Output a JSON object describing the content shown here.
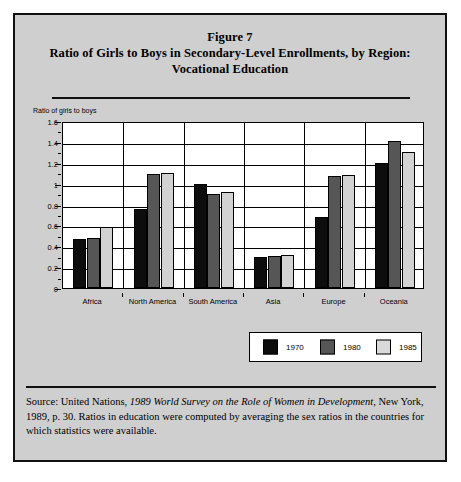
{
  "figure": {
    "title_line1": "Figure 7",
    "title_line2": "Ratio of Girls to Boys in Secondary-Level Enrollments, by Region:",
    "title_line3": "Vocational Education"
  },
  "source": {
    "prefix": "Source: United Nations, ",
    "italic_title": "1989 World Survey on the Role of Women in Development,",
    "rest": " New York, 1989, p. 30. Ratios in education were computed by averaging the sex ratios in the countries for which statistics were available."
  },
  "legend": {
    "entries": [
      {
        "label": "1970",
        "color": "#0d0d0d"
      },
      {
        "label": "1980",
        "color": "#565656"
      },
      {
        "label": "1985",
        "color": "#d9d9d9"
      }
    ]
  },
  "chart_data": {
    "type": "bar",
    "title": "Ratio of Girls to Boys in Secondary-Level Enrollments, by Region: Vocational Education",
    "xlabel": "",
    "ylabel": "Ratio of girls to boys",
    "ylim": [
      0,
      1.6
    ],
    "ytick_labels": [
      "1.6",
      "1.4",
      "1.2",
      "1",
      "0.8",
      "0.6",
      "0.4",
      "0.2",
      "0"
    ],
    "ytick_values": [
      1.6,
      1.4,
      1.2,
      1.0,
      0.8,
      0.6,
      0.4,
      0.2,
      0
    ],
    "grid": true,
    "legend_position": "below-right",
    "categories": [
      "Africa",
      "North America",
      "South America",
      "Asia",
      "Europe",
      "Oceania"
    ],
    "series": [
      {
        "name": "1970",
        "color": "#0d0d0d",
        "values": [
          0.47,
          0.76,
          1.0,
          0.3,
          0.68,
          1.2
        ]
      },
      {
        "name": "1980",
        "color": "#565656",
        "values": [
          0.48,
          1.09,
          0.9,
          0.31,
          1.07,
          1.41
        ]
      },
      {
        "name": "1985",
        "color": "#d2d2d2",
        "values": [
          0.58,
          1.1,
          0.92,
          0.32,
          1.08,
          1.3
        ]
      }
    ]
  }
}
